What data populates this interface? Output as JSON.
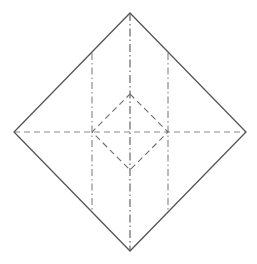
{
  "diagram": {
    "type": "origami-crease-pattern",
    "colors": {
      "background": "#ffffff",
      "edge": "#555555",
      "valley": "#8a8a8a",
      "mountain": "#666666"
    },
    "outer_square": {
      "points": [
        [
          130,
          13
        ],
        [
          246,
          132
        ],
        [
          130,
          251
        ],
        [
          14,
          132
        ]
      ]
    },
    "creases": {
      "horizontal_valley": {
        "x1": 14,
        "y1": 132,
        "x2": 246,
        "y2": 132,
        "style": "dashed"
      },
      "center_vertical_mountain": {
        "x1": 130,
        "y1": 13,
        "x2": 130,
        "y2": 251,
        "style": "dash-dot"
      },
      "left_vertical_mountain": {
        "x1": 92,
        "y1": 53,
        "x2": 92,
        "y2": 212,
        "style": "dash-dot"
      },
      "right_vertical_mountain": {
        "x1": 168,
        "y1": 53,
        "x2": 168,
        "y2": 212,
        "style": "dash-dot"
      },
      "inner_diamond_valley": {
        "points": [
          [
            130,
            94
          ],
          [
            168,
            132
          ],
          [
            130,
            170
          ],
          [
            92,
            132
          ]
        ],
        "style": "dashed"
      }
    }
  }
}
